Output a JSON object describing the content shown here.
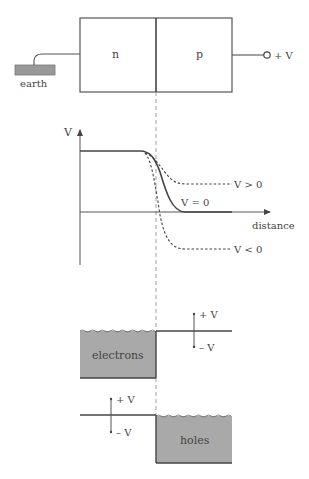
{
  "junction": {
    "n_label": "n",
    "p_label": "p",
    "earth_label": "earth",
    "terminal_label": "+ V"
  },
  "graph": {
    "y_axis_label": "V",
    "x_axis_label": "distance",
    "curves": [
      {
        "label": "V > 0",
        "style": "dashed"
      },
      {
        "label": "V = 0",
        "style": "solid"
      },
      {
        "label": "V < 0",
        "style": "dashed"
      }
    ]
  },
  "bands": {
    "electrons_label": "electrons",
    "holes_label": "holes",
    "plus_v": "+ V",
    "minus_v": "– V"
  },
  "colors": {
    "line": "#444444",
    "fill": "#a9a9a9",
    "background": "#ffffff"
  }
}
